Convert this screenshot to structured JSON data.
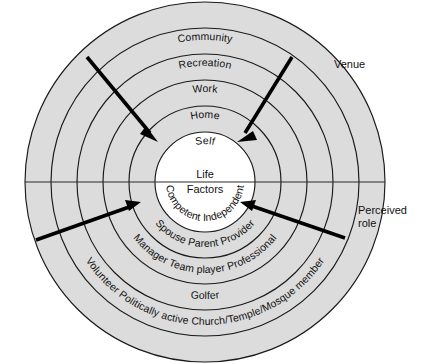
{
  "diagram": {
    "hub": {
      "line1": "Life",
      "line2": "Factors"
    },
    "side_labels": {
      "venue": "Venue",
      "perceived_role": "Perceived\nrole"
    },
    "geometry": {
      "center_x": 205,
      "center_y": 182,
      "hub_radius": 50,
      "ring_thickness": 26,
      "outer_radius": 180,
      "ring_count": 5
    },
    "colors": {
      "ring_fill": "#dcdcdc",
      "hub_fill": "#ffffff",
      "stroke": "#1a1a1a",
      "arrow": "#000000",
      "text": "#111111",
      "background": "#ffffff"
    },
    "venue_rings": [
      {
        "index": 1,
        "label": "Self"
      },
      {
        "index": 2,
        "label": "Home"
      },
      {
        "index": 3,
        "label": "Work"
      },
      {
        "index": 4,
        "label": "Recreation"
      },
      {
        "index": 5,
        "label": "Community"
      }
    ],
    "perceived_role_rings": [
      {
        "index": 1,
        "label": "Competent  Independent"
      },
      {
        "index": 2,
        "label": "Spouse   Parent   Provider"
      },
      {
        "index": 3,
        "label": "Manager   Team player   Professional"
      },
      {
        "index": 4,
        "label": "Golfer"
      },
      {
        "index": 5,
        "label": "Volunteer  Politically active  Church/Temple/Mosque member"
      }
    ],
    "arrows": [
      {
        "name": "arrow-top-left",
        "x1": 87,
        "y1": 57,
        "x2": 158,
        "y2": 142
      },
      {
        "name": "arrow-top-right",
        "x1": 292,
        "y1": 57,
        "x2": 237,
        "y2": 142
      },
      {
        "name": "arrow-bottom-left",
        "x1": 36,
        "y1": 240,
        "x2": 141,
        "y2": 202
      },
      {
        "name": "arrow-bottom-right",
        "x1": 345,
        "y1": 238,
        "x2": 240,
        "y2": 202
      }
    ],
    "divider": {
      "name": "horizontal-divider",
      "x1": 25,
      "y1": 182,
      "x2": 385,
      "y2": 182
    }
  }
}
